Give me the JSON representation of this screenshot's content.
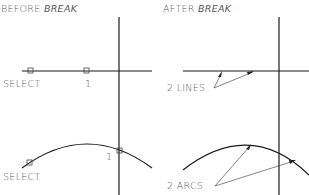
{
  "panels": {
    "before": {
      "title_prefix": "BEFORE ",
      "title_command": "BREAK"
    },
    "after": {
      "title_prefix": "AFTER ",
      "title_command": "BREAK"
    }
  },
  "labels": {
    "select_line": "SELECT",
    "point1_line": "1",
    "two_lines": "2 LINES",
    "select_arc": "SELECT",
    "point1_arc": "1",
    "two_arcs": "2 ARCS"
  },
  "colors": {
    "line": "#1a1a1a",
    "text": "#555555",
    "background": "#ffffff"
  }
}
